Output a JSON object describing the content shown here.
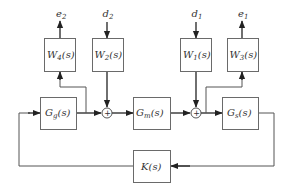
{
  "diagram": {
    "type": "block-diagram",
    "blocks": {
      "W4": {
        "base": "W",
        "sub": "4",
        "arg": "(s)"
      },
      "W2": {
        "base": "W",
        "sub": "2",
        "arg": "(s)"
      },
      "W1": {
        "base": "W",
        "sub": "1",
        "arg": "(s)"
      },
      "W3": {
        "base": "W",
        "sub": "3",
        "arg": "(s)"
      },
      "Gg": {
        "base": "G",
        "sub": "g",
        "arg": "(s)"
      },
      "Gm": {
        "base": "G",
        "sub": "m",
        "arg": "(s)"
      },
      "Gs": {
        "base": "G",
        "sub": "s",
        "arg": "(s)"
      },
      "K": {
        "base": "K",
        "sub": "",
        "arg": "(s)"
      }
    },
    "signals": {
      "e2": {
        "base": "e",
        "sub": "2"
      },
      "d2": {
        "base": "d",
        "sub": "2"
      },
      "d1": {
        "base": "d",
        "sub": "1"
      },
      "e1": {
        "base": "e",
        "sub": "1"
      }
    },
    "summing_junctions": {
      "sum1": {
        "sign": "+"
      },
      "sum2": {
        "sign": "+"
      }
    },
    "connections": [
      "K -> Gg (feedback, left loop)",
      "Gg -> sum1",
      "Gg output -> W4 -> e2",
      "d2 -> W2 -> sum1",
      "sum1 -> Gm",
      "Gm -> sum2",
      "d1 -> W1 -> sum2",
      "sum2 -> Gs",
      "sum2 output -> W3 -> e1",
      "Gs -> K (feedback, right loop)"
    ],
    "colors": {
      "line": "#555555",
      "box_border": "#6a6a6a",
      "text": "#333333"
    }
  }
}
